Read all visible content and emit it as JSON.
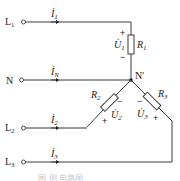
{
  "diagram": {
    "type": "three-phase four-wire star-connected load circuit",
    "terminals": {
      "L1": {
        "main": "L",
        "sub": "1"
      },
      "N": {
        "main": "N"
      },
      "L2": {
        "main": "L",
        "sub": "2"
      },
      "L3": {
        "main": "L",
        "sub": "3"
      }
    },
    "currents": {
      "i1": {
        "main": "İ",
        "sub": "1"
      },
      "iN": {
        "main": "İ",
        "sub": "N"
      },
      "i2": {
        "main": "İ",
        "sub": "2"
      },
      "i3": {
        "main": "İ",
        "sub": "3"
      }
    },
    "resistors": {
      "R1": {
        "main": "R",
        "sub": "1"
      },
      "R2": {
        "main": "R",
        "sub": "2"
      },
      "R3": {
        "main": "R",
        "sub": "3"
      }
    },
    "voltages": {
      "U1": {
        "main": "U̇",
        "sub": "1",
        "plus": "+",
        "minus": "−"
      },
      "U2": {
        "main": "U̇",
        "sub": "2",
        "plus": "+",
        "minus": "−"
      },
      "U3": {
        "main": "U̇",
        "sub": "3",
        "plus": "+",
        "minus": "−"
      }
    },
    "node": {
      "label": "N'"
    },
    "caption": "图 例 电路图"
  }
}
